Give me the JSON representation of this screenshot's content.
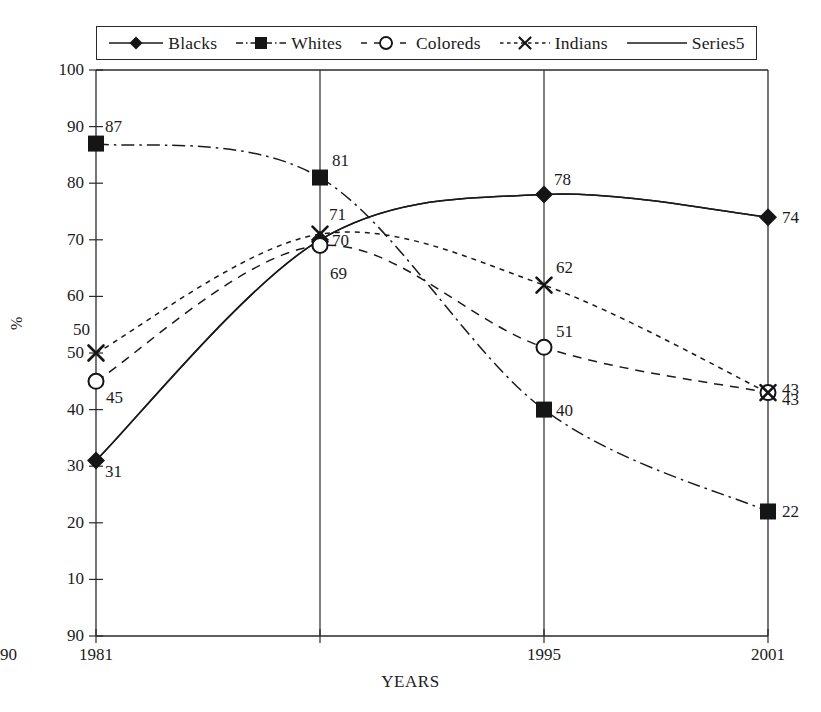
{
  "chart_data": {
    "type": "line",
    "title": "",
    "xlabel": "YEARS",
    "ylabel": "%",
    "categories": [
      "1981",
      "1990",
      "1995",
      "2001"
    ],
    "x_tick_labels": [
      "1981",
      "1990",
      "1995",
      "2001"
    ],
    "y_tick_labels": [
      "100",
      "90",
      "80",
      "70",
      "60",
      "50",
      "40",
      "30",
      "20",
      "10",
      "90"
    ],
    "y_tick_values": [
      100,
      90,
      80,
      70,
      60,
      50,
      40,
      30,
      20,
      10,
      0
    ],
    "ylim": [
      0,
      100
    ],
    "grid": "vertical-category-lines",
    "legend_position": "top-center-boxed",
    "smoothed_lines": true,
    "series": [
      {
        "name": "Blacks",
        "marker": "filled-diamond",
        "line_style": "solid",
        "values": [
          31,
          70,
          78,
          74
        ],
        "labels": [
          "31",
          "70",
          "78",
          "74"
        ]
      },
      {
        "name": "Whites",
        "marker": "filled-square",
        "line_style": "dash-dot",
        "values": [
          87,
          81,
          40,
          22
        ],
        "labels": [
          "87",
          "81",
          "40",
          "22"
        ]
      },
      {
        "name": "Coloreds",
        "marker": "hollow-circle",
        "line_style": "dashed",
        "values": [
          45,
          69,
          51,
          43
        ],
        "labels": [
          "45",
          "69",
          "51",
          "43"
        ]
      },
      {
        "name": "Indians",
        "marker": "x-cross",
        "line_style": "dotted-dash",
        "values": [
          50,
          71,
          62,
          43
        ],
        "labels": [
          "50",
          "71",
          "62",
          "43"
        ]
      },
      {
        "name": "Series5",
        "marker": "none",
        "line_style": "solid",
        "values": [
          31,
          70,
          78,
          74
        ],
        "labels": []
      }
    ]
  },
  "legend": {
    "entries": [
      {
        "label": "Blacks"
      },
      {
        "label": "Whites"
      },
      {
        "label": "Coloreds"
      },
      {
        "label": "Indians"
      },
      {
        "label": "Series5"
      }
    ]
  },
  "axes": {
    "y_title": "%",
    "x_title": "YEARS"
  }
}
